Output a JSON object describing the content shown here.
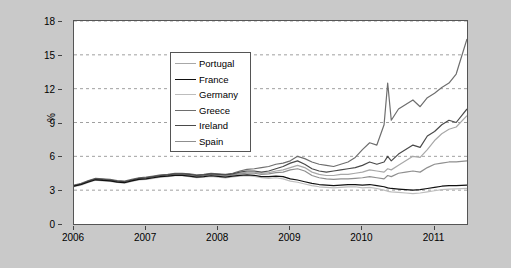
{
  "figure": {
    "background_color": "#c9c9c9",
    "plot_background_color": "#ffffff",
    "frame_color": "#555555",
    "grid_color": "#888888"
  },
  "axes": {
    "ylabel": "%",
    "y_ticks": [
      "0",
      "3",
      "6",
      "9",
      "12",
      "15",
      "18"
    ],
    "x_ticks": [
      "2006",
      "2007",
      "2008",
      "2009",
      "2010",
      "2011"
    ]
  },
  "legend": {
    "entries": [
      {
        "label": "Portugal",
        "color": "#a8a8a8"
      },
      {
        "label": "France",
        "color": "#111111"
      },
      {
        "label": "Germany",
        "color": "#bdbdbd"
      },
      {
        "label": "Greece",
        "color": "#6e6e6e"
      },
      {
        "label": "Ireland",
        "color": "#4a4a4a"
      },
      {
        "label": "Spain",
        "color": "#8f8f8f"
      }
    ]
  },
  "chart_data": {
    "type": "line",
    "title": "",
    "xlabel": "",
    "ylabel": "%",
    "xlim": [
      2006.0,
      2011.45
    ],
    "ylim": [
      0,
      18
    ],
    "y_ticks": [
      0,
      3,
      6,
      9,
      12,
      15,
      18
    ],
    "x_ticks": [
      2006,
      2007,
      2008,
      2009,
      2010,
      2011
    ],
    "grid": "horizontal-dashed",
    "legend_position": "upper-left",
    "x": [
      2006.0,
      2006.1,
      2006.2,
      2006.3,
      2006.4,
      2006.5,
      2006.6,
      2006.7,
      2006.8,
      2006.9,
      2007.0,
      2007.1,
      2007.2,
      2007.3,
      2007.4,
      2007.5,
      2007.6,
      2007.7,
      2007.8,
      2007.9,
      2008.0,
      2008.1,
      2008.2,
      2008.3,
      2008.4,
      2008.5,
      2008.6,
      2008.7,
      2008.8,
      2008.9,
      2009.0,
      2009.1,
      2009.2,
      2009.3,
      2009.4,
      2009.5,
      2009.6,
      2009.7,
      2009.8,
      2009.9,
      2010.0,
      2010.1,
      2010.2,
      2010.3,
      2010.35,
      2010.4,
      2010.5,
      2010.6,
      2010.7,
      2010.8,
      2010.9,
      2011.0,
      2011.1,
      2011.2,
      2011.3,
      2011.45
    ],
    "series": [
      {
        "name": "Greece",
        "color": "#6e6e6e",
        "values": [
          3.45,
          3.6,
          3.85,
          4.05,
          4.0,
          3.95,
          3.85,
          3.8,
          3.95,
          4.1,
          4.15,
          4.25,
          4.35,
          4.4,
          4.5,
          4.5,
          4.45,
          4.35,
          4.4,
          4.5,
          4.45,
          4.4,
          4.5,
          4.7,
          4.85,
          4.9,
          5.0,
          5.1,
          5.3,
          5.4,
          5.6,
          6.0,
          5.8,
          5.5,
          5.3,
          5.2,
          5.1,
          5.3,
          5.5,
          5.9,
          6.6,
          7.2,
          7.0,
          8.8,
          12.5,
          9.2,
          10.2,
          10.6,
          11.0,
          10.4,
          11.2,
          11.6,
          12.1,
          12.5,
          13.3,
          16.4
        ]
      },
      {
        "name": "Ireland",
        "color": "#4a4a4a",
        "values": [
          3.4,
          3.55,
          3.8,
          4.0,
          3.95,
          3.9,
          3.8,
          3.75,
          3.9,
          4.05,
          4.1,
          4.2,
          4.3,
          4.35,
          4.45,
          4.45,
          4.4,
          4.3,
          4.35,
          4.45,
          4.4,
          4.35,
          4.45,
          4.6,
          4.7,
          4.7,
          4.6,
          4.7,
          4.9,
          5.1,
          5.4,
          5.6,
          5.3,
          4.9,
          4.7,
          4.6,
          4.7,
          4.8,
          4.9,
          5.0,
          5.2,
          5.5,
          5.3,
          5.5,
          6.0,
          5.6,
          6.2,
          6.6,
          7.0,
          6.8,
          7.8,
          8.2,
          8.8,
          9.2,
          9.0,
          10.2
        ]
      },
      {
        "name": "Portugal",
        "color": "#a8a8a8",
        "values": [
          3.4,
          3.55,
          3.78,
          3.98,
          3.92,
          3.88,
          3.78,
          3.72,
          3.88,
          4.0,
          4.08,
          4.18,
          4.28,
          4.32,
          4.42,
          4.42,
          4.35,
          4.28,
          4.32,
          4.4,
          4.35,
          4.3,
          4.4,
          4.5,
          4.6,
          4.6,
          4.5,
          4.55,
          4.7,
          4.8,
          5.0,
          5.2,
          5.0,
          4.6,
          4.4,
          4.3,
          4.3,
          4.4,
          4.4,
          4.5,
          4.6,
          4.8,
          4.7,
          4.6,
          4.9,
          4.8,
          5.2,
          5.6,
          6.0,
          5.9,
          6.6,
          7.4,
          8.0,
          8.4,
          8.6,
          9.6
        ]
      },
      {
        "name": "Spain",
        "color": "#8f8f8f",
        "values": [
          3.38,
          3.52,
          3.75,
          3.95,
          3.9,
          3.85,
          3.75,
          3.7,
          3.85,
          3.98,
          4.05,
          4.15,
          4.25,
          4.3,
          4.38,
          4.38,
          4.3,
          4.22,
          4.28,
          4.35,
          4.3,
          4.25,
          4.35,
          4.45,
          4.5,
          4.5,
          4.4,
          4.45,
          4.55,
          4.6,
          4.8,
          4.9,
          4.7,
          4.3,
          4.1,
          4.0,
          3.95,
          4.0,
          4.0,
          4.05,
          4.1,
          4.2,
          4.1,
          4.0,
          4.3,
          4.2,
          4.5,
          4.6,
          4.7,
          4.6,
          5.0,
          5.3,
          5.4,
          5.5,
          5.5,
          5.6
        ]
      },
      {
        "name": "France",
        "color": "#111111",
        "values": [
          3.35,
          3.5,
          3.72,
          3.92,
          3.86,
          3.82,
          3.72,
          3.66,
          3.82,
          3.95,
          4.0,
          4.1,
          4.2,
          4.25,
          4.32,
          4.32,
          4.25,
          4.15,
          4.2,
          4.28,
          4.22,
          4.15,
          4.25,
          4.32,
          4.35,
          4.32,
          4.2,
          4.2,
          4.25,
          4.2,
          4.0,
          3.9,
          3.75,
          3.6,
          3.5,
          3.45,
          3.4,
          3.45,
          3.5,
          3.5,
          3.45,
          3.5,
          3.4,
          3.3,
          3.2,
          3.15,
          3.1,
          3.05,
          3.0,
          3.05,
          3.15,
          3.25,
          3.35,
          3.4,
          3.4,
          3.45
        ]
      },
      {
        "name": "Germany",
        "color": "#bdbdbd",
        "values": [
          3.3,
          3.45,
          3.68,
          3.88,
          3.82,
          3.78,
          3.68,
          3.62,
          3.78,
          3.9,
          3.95,
          4.05,
          4.15,
          4.2,
          4.28,
          4.28,
          4.2,
          4.1,
          4.15,
          4.22,
          4.15,
          4.08,
          4.18,
          4.25,
          4.28,
          4.22,
          4.1,
          4.05,
          4.1,
          4.0,
          3.8,
          3.7,
          3.55,
          3.4,
          3.3,
          3.25,
          3.2,
          3.25,
          3.3,
          3.3,
          3.2,
          3.25,
          3.15,
          3.0,
          2.9,
          2.85,
          2.8,
          2.75,
          2.7,
          2.75,
          2.85,
          2.95,
          3.05,
          3.1,
          3.12,
          3.15
        ]
      }
    ]
  }
}
